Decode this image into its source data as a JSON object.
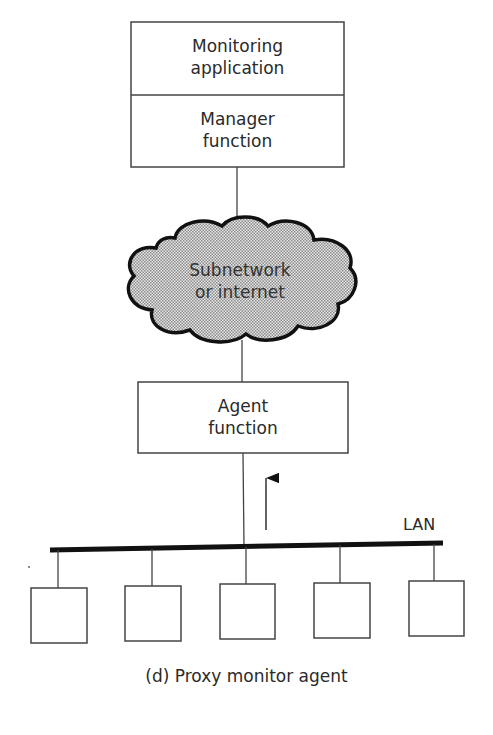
{
  "diagram": {
    "manager_stack": {
      "top_label_line1": "Monitoring",
      "top_label_line2": "application",
      "bottom_label_line1": "Manager",
      "bottom_label_line2": "function"
    },
    "cloud": {
      "label_line1": "Subnetwork",
      "label_line2": "or internet"
    },
    "agent": {
      "label_line1": "Agent",
      "label_line2": "function"
    },
    "lan": {
      "label": "LAN",
      "device_count": 5
    },
    "caption": "(d) Proxy monitor agent"
  }
}
